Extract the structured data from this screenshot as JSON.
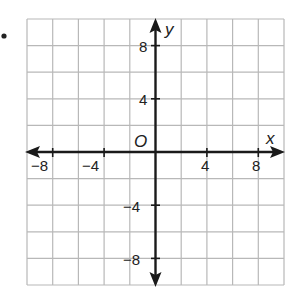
{
  "figure": {
    "bullet": "•",
    "x_axis_label": "x",
    "y_axis_label": "y",
    "origin_label": "O",
    "x_tick_labels": [
      {
        "value": -8,
        "text": "−8"
      },
      {
        "value": -4,
        "text": "−4"
      },
      {
        "value": 4,
        "text": "4"
      },
      {
        "value": 8,
        "text": "8"
      }
    ],
    "y_tick_labels": [
      {
        "value": 8,
        "text": "8"
      },
      {
        "value": 4,
        "text": "4"
      },
      {
        "value": -4,
        "text": "−4"
      },
      {
        "value": -8,
        "text": "−8"
      }
    ],
    "grid": {
      "min": -10,
      "max": 10,
      "step": 2
    },
    "colors": {
      "grid": "#b8b8b8",
      "axis": "#1a1a1a",
      "text": "#222222"
    }
  }
}
